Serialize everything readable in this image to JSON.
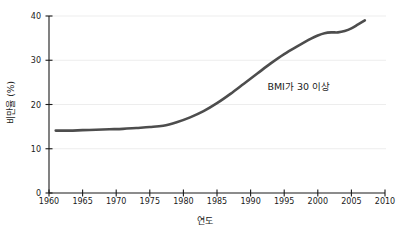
{
  "chart_data": {
    "type": "line",
    "title": "",
    "xlabel": "연도",
    "ylabel": "비만율 (%)",
    "xlim": [
      1960,
      2010
    ],
    "ylim": [
      0,
      40
    ],
    "grid": true,
    "grid_axis": "y",
    "legend": "none",
    "line_color": "#4d4d4d",
    "axis_color": "#1a1a1a",
    "grid_color": "#ededed",
    "background_color": "#ffffff",
    "x_ticks": [
      1960,
      1965,
      1970,
      1975,
      1980,
      1985,
      1990,
      1995,
      2000,
      2005,
      2010
    ],
    "x_tick_labels": [
      "1960",
      "1965",
      "1970",
      "1975",
      "1980",
      "1985",
      "1990",
      "1995",
      "2000",
      "2005",
      "2010"
    ],
    "y_ticks": [
      0,
      10,
      20,
      30,
      40
    ],
    "y_tick_labels": [
      "0",
      "10",
      "20",
      "30",
      "40"
    ],
    "annotations": [
      {
        "text": "BMI가 30 이상",
        "x": 1992.5,
        "y": 24.5
      }
    ],
    "series": [
      {
        "name": "BMI가 30 이상",
        "x": [
          1961,
          1963,
          1965,
          1967,
          1969,
          1971,
          1973,
          1975,
          1977,
          1979,
          1981,
          1983,
          1985,
          1987,
          1989,
          1991,
          1993,
          1995,
          1997,
          1999,
          2000,
          2001,
          2002,
          2003,
          2004,
          2005,
          2006,
          2007
        ],
        "values": [
          14.1,
          14.1,
          14.2,
          14.3,
          14.4,
          14.5,
          14.7,
          14.9,
          15.2,
          16.0,
          17.1,
          18.5,
          20.3,
          22.4,
          24.7,
          27.0,
          29.3,
          31.4,
          33.2,
          34.9,
          35.6,
          36.1,
          36.3,
          36.3,
          36.6,
          37.2,
          38.1,
          39.0
        ]
      }
    ]
  }
}
